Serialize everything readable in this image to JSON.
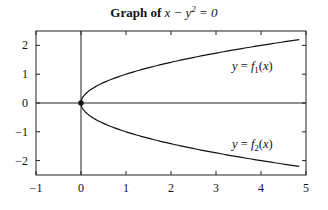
{
  "chart_data": {
    "type": "line",
    "title_parts": {
      "bold": "Graph of",
      "math": "x − y² = 0"
    },
    "xlabel": "",
    "ylabel": "",
    "xlim": [
      -1,
      5
    ],
    "ylim": [
      -2.5,
      2.5
    ],
    "x_ticks": [
      -1,
      0,
      1,
      2,
      3,
      4,
      5
    ],
    "x_tick_labels": [
      "−1",
      "0",
      "1",
      "2",
      "3",
      "4",
      "5"
    ],
    "y_ticks": [
      -2,
      -1,
      0,
      1,
      2
    ],
    "y_tick_labels": [
      "−2",
      "−1",
      "0",
      "1",
      "2"
    ],
    "grid": false,
    "reference_lines": {
      "x_axis": 0,
      "y_axis": 0
    },
    "series": [
      {
        "name": "y = f1(x)",
        "equation": "y = sqrt(x)",
        "x": [
          0,
          0.25,
          0.5,
          1,
          1.5,
          2,
          2.5,
          3,
          3.5,
          4,
          4.5,
          4.85
        ],
        "y": [
          0,
          0.5,
          0.71,
          1,
          1.22,
          1.41,
          1.58,
          1.73,
          1.87,
          2,
          2.12,
          2.2
        ]
      },
      {
        "name": "y = f2(x)",
        "equation": "y = -sqrt(x)",
        "x": [
          0,
          0.25,
          0.5,
          1,
          1.5,
          2,
          2.5,
          3,
          3.5,
          4,
          4.5,
          4.85
        ],
        "y": [
          0,
          -0.5,
          -0.71,
          -1,
          -1.22,
          -1.41,
          -1.58,
          -1.73,
          -1.87,
          -2,
          -2.12,
          -2.2
        ]
      }
    ],
    "points": [
      {
        "label": "origin",
        "x": 0,
        "y": 0
      }
    ],
    "annotations": [
      {
        "text": "y = f1(x)",
        "x": 3.9,
        "y": 1.3
      },
      {
        "text": "y = f2(x)",
        "x": 3.9,
        "y": -1.45
      }
    ],
    "legend": null
  },
  "labels": {
    "title_bold": "Graph of",
    "title_math": "x − y² = 0",
    "f1": "y = f",
    "f1_sub": "1",
    "f1_tail": "(x)",
    "f2": "y = f",
    "f2_sub": "2",
    "f2_tail": "(x)"
  },
  "colors": {
    "line": "#111111",
    "frame": "#222222",
    "background": "#ffffff"
  }
}
